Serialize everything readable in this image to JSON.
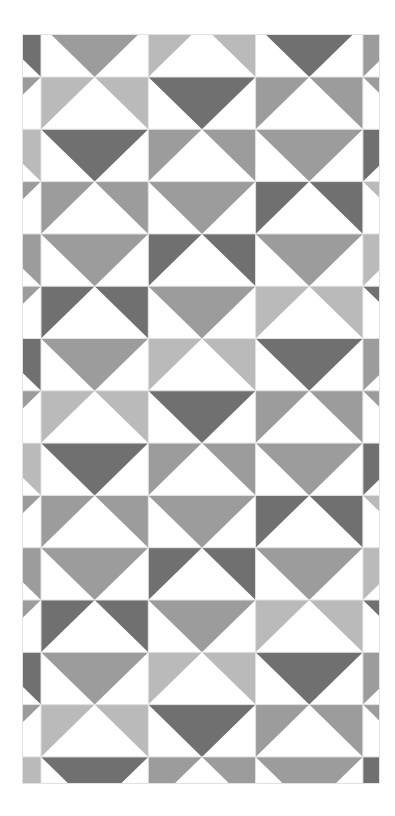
{
  "canvas": {
    "width": 395,
    "height": 816,
    "background": "#ffffff"
  },
  "pattern": {
    "left": 22,
    "top": 34,
    "right": 380,
    "bottom": 784,
    "cell_width": 107.3,
    "cell_height": 52.3,
    "origin_x": -66.3,
    "origin_y": 24.7,
    "columns": 5,
    "rows": 15,
    "grid_line_color": "#e2e2e2",
    "shade_colors": {
      "L": "#bababa",
      "M": "#9c9c9c",
      "D": "#707070"
    },
    "cell_types": {
      "V": "colored downward triangle, white corners",
      "H": "colored corner triangles, white upward triangle"
    },
    "row_templates": [
      [
        "H-D",
        "V-M",
        "H-L",
        "V-D",
        "H-M"
      ],
      [
        "V-M",
        "H-L",
        "V-D",
        "H-M",
        "V-M"
      ],
      [
        "H-L",
        "V-D",
        "H-M",
        "V-M",
        "H-D"
      ],
      [
        "V-M",
        "H-M",
        "V-M",
        "H-D",
        "V-L"
      ],
      [
        "H-M",
        "V-M",
        "H-D",
        "V-M",
        "H-L"
      ],
      [
        "V-M",
        "H-D",
        "V-M",
        "H-L",
        "V-D"
      ]
    ],
    "row_sequence": [
      0,
      1,
      2,
      3,
      4,
      5,
      0,
      1,
      2,
      3,
      4,
      5,
      0,
      1,
      2
    ]
  }
}
